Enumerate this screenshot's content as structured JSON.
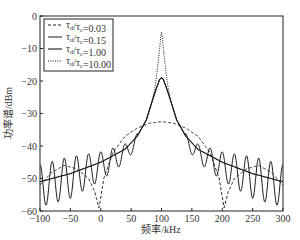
{
  "chart_data": {
    "type": "line",
    "title": "",
    "xlabel": "频率/kHz",
    "ylabel": "功率谱/dBm",
    "xlim": [
      -100,
      300
    ],
    "ylim": [
      -60,
      0
    ],
    "xticks": [
      -100,
      -50,
      0,
      50,
      100,
      150,
      200,
      250,
      300
    ],
    "yticks": [
      0,
      -10,
      -20,
      -30,
      -40,
      -50,
      -60
    ],
    "grid": false,
    "legend_position": "upper left",
    "series": [
      {
        "name": "τd/τc=0.03",
        "label_main": "τ",
        "label_sub1": "d",
        "label_mid": "/τ",
        "label_sub2": "c",
        "label_val": "=0.03",
        "style": "dashed",
        "x": [
          -100,
          -80,
          -60,
          -40,
          -20,
          -10,
          -3,
          0,
          5,
          20,
          40,
          60,
          80,
          100,
          120,
          140,
          160,
          180,
          195,
          203,
          210,
          220,
          240,
          260,
          280,
          300
        ],
        "values": [
          -52,
          -48,
          -46,
          -47,
          -50,
          -54,
          -59,
          -56,
          -50,
          -42,
          -37,
          -34.5,
          -33,
          -32.5,
          -33,
          -34.5,
          -37,
          -42,
          -50,
          -59,
          -54,
          -50,
          -47,
          -46,
          -48,
          -52
        ]
      },
      {
        "name": "τd/τc=0.15",
        "label_main": "τ",
        "label_sub1": "d",
        "label_mid": "/τ",
        "label_sub2": "c",
        "label_val": "=0.15",
        "style": "solid-oscillating",
        "envelope_upper": [
          -49,
          -47,
          -44,
          -41,
          -38
        ],
        "envelope_lower": [
          -57,
          -55,
          -52,
          -48,
          -44
        ],
        "peak": -19,
        "oscillation_period_khz": 20
      },
      {
        "name": "τd/τc=1.00",
        "label_main": "τ",
        "label_sub1": "d",
        "label_mid": "/τ",
        "label_sub2": "c",
        "label_val": "=1.00",
        "style": "solid",
        "x": [
          -100,
          -50,
          0,
          40,
          60,
          75,
          85,
          92,
          97,
          100,
          103,
          108,
          115,
          125,
          140,
          160,
          200,
          250,
          300
        ],
        "values": [
          -51,
          -48.5,
          -45,
          -41,
          -37,
          -32,
          -26,
          -22,
          -19.5,
          -19,
          -19.5,
          -22,
          -26,
          -32,
          -37,
          -41,
          -45,
          -48.5,
          -51
        ]
      },
      {
        "name": "τd/τc=10.00",
        "label_main": "τ",
        "label_sub1": "d",
        "label_mid": "/τ",
        "label_sub2": "c",
        "label_val": "=10.00",
        "style": "dotted",
        "x": [
          -100,
          -50,
          0,
          40,
          60,
          75,
          85,
          90,
          94,
          97,
          99,
          100,
          101,
          103,
          106,
          110,
          115,
          125,
          140,
          160,
          200,
          250,
          300
        ],
        "values": [
          -51,
          -48.5,
          -45,
          -41,
          -37,
          -32,
          -26,
          -21,
          -15,
          -10,
          -6,
          -5,
          -6,
          -10,
          -15,
          -21,
          -26,
          -32,
          -37,
          -41,
          -45,
          -48.5,
          -51
        ]
      }
    ]
  }
}
